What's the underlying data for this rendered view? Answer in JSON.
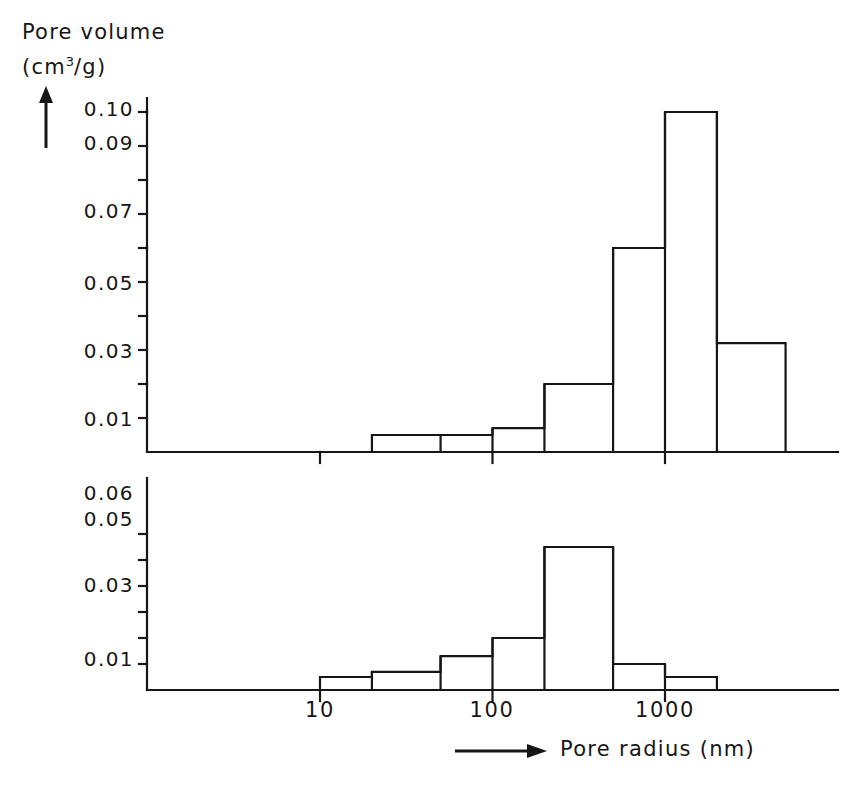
{
  "chart_data": {
    "type": "bar",
    "title": "",
    "subtitle": "",
    "ylabel_line1": "Pore volume",
    "ylabel_line2_prefix": "(cm",
    "ylabel_line2_sup": "3",
    "ylabel_line2_suffix": "/g)",
    "xlabel": "Pore radius (nm)",
    "xscale": "log",
    "xlim": [
      3.5,
      6000
    ],
    "xticks": [
      10,
      100,
      1000
    ],
    "xticklabels": [
      "10",
      "100",
      "1000"
    ],
    "grid": false,
    "legend": null,
    "panels": [
      {
        "name": "top-panel",
        "ylim": [
          0,
          0.105
        ],
        "yticks": [
          0.01,
          0.02,
          0.03,
          0.04,
          0.05,
          0.06,
          0.07,
          0.08,
          0.09,
          0.1
        ],
        "yticklabels": [
          "0.01",
          "",
          "0.03",
          "",
          "0.05",
          "",
          "0.07",
          "",
          "0.09",
          "0.10"
        ],
        "bin_edges": [
          20,
          50,
          100,
          200,
          500,
          1000,
          2000,
          5000
        ],
        "values": [
          0.005,
          0.005,
          0.007,
          0.02,
          0.06,
          0.1,
          0.032
        ]
      },
      {
        "name": "bottom-panel",
        "ylim": [
          0,
          0.065
        ],
        "yticks": [
          0.01,
          0.02,
          0.03,
          0.04,
          0.05,
          0.06
        ],
        "yticklabels": [
          "0.01",
          "",
          "0.03",
          "",
          "0.05",
          "0.06"
        ],
        "bin_edges": [
          10,
          20,
          50,
          100,
          200,
          500,
          1000,
          2000
        ],
        "values": [
          0.005,
          0.007,
          0.013,
          0.02,
          0.055,
          0.01,
          0.005
        ]
      }
    ]
  },
  "labels": {
    "top_ticks": [
      {
        "text": "0.10",
        "y": 108
      },
      {
        "text": "0.09",
        "y": 142
      },
      {
        "text": "0.07",
        "y": 210
      },
      {
        "text": "0.05",
        "y": 282
      },
      {
        "text": "0.03",
        "y": 350
      },
      {
        "text": "0.01",
        "y": 418
      }
    ],
    "bottom_ticks": [
      {
        "text": "0.06",
        "y": 492
      },
      {
        "text": "0.05",
        "y": 518
      },
      {
        "text": "0.03",
        "y": 584
      },
      {
        "text": "0.01",
        "y": 658
      }
    ],
    "x_ticks": [
      {
        "text": "10",
        "x": 320
      },
      {
        "text": "100",
        "x": 492
      },
      {
        "text": "1000",
        "x": 665
      }
    ]
  }
}
